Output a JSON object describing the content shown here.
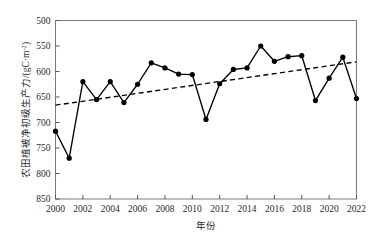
{
  "chart_data": {
    "type": "line",
    "title": "",
    "xlabel": "年份",
    "ylabel": "农田植被净初级生产力/(gC·m",
    "ylabel_sup": "-2",
    "ylabel_sup_close": ")",
    "xlim": [
      2000,
      2022
    ],
    "ylim": [
      500,
      850
    ],
    "xticks": [
      2000,
      2002,
      2004,
      2006,
      2008,
      2010,
      2012,
      2014,
      2016,
      2018,
      2020,
      2022
    ],
    "yticks": [
      500,
      550,
      600,
      650,
      700,
      750,
      800,
      850
    ],
    "grid": false,
    "legend": "none",
    "x": [
      2000,
      2001,
      2002,
      2003,
      2004,
      2005,
      2006,
      2007,
      2008,
      2009,
      2010,
      2011,
      2012,
      2013,
      2014,
      2015,
      2016,
      2017,
      2018,
      2019,
      2020,
      2021,
      2022
    ],
    "series": [
      {
        "name": "农田植被净初级生产力",
        "style": "solid-with-markers",
        "color": "#000000",
        "values": [
          633,
          580,
          730,
          695,
          730,
          689,
          725,
          767,
          757,
          745,
          744,
          656,
          726,
          754,
          757,
          800,
          770,
          779,
          781,
          693,
          737,
          778,
          697
        ]
      },
      {
        "name": "线性趋势线",
        "style": "dashed",
        "color": "#000000",
        "values": [
          684,
          688,
          692,
          696,
          700,
          703,
          707,
          711,
          715,
          719,
          723,
          727,
          730,
          734,
          738,
          742,
          746,
          750,
          754,
          757,
          761,
          765,
          769
        ]
      }
    ]
  },
  "axis": {
    "y_tick_labels": [
      "850",
      "800",
      "750",
      "700",
      "650",
      "600",
      "550",
      "500"
    ],
    "x_tick_labels": [
      "2000",
      "2002",
      "2004",
      "2006",
      "2008",
      "2010",
      "2012",
      "2014",
      "2016",
      "2018",
      "2020",
      "2022"
    ]
  }
}
